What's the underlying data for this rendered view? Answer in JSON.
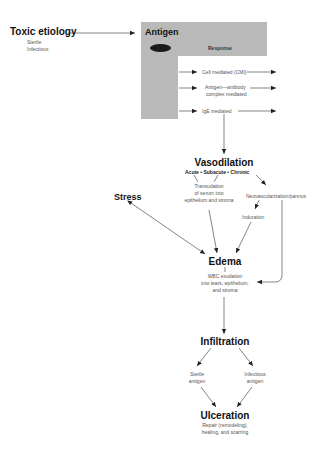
{
  "diagram": {
    "toxic_etiology": {
      "title": "Toxic etiology",
      "items": [
        "Sterile",
        "Infectious"
      ]
    },
    "antigen_box": {
      "title": "Antigen",
      "response_label": "Response",
      "responses": [
        {
          "line1": "Cell mediated (CMI)",
          "line2": ""
        },
        {
          "line1": "Antigen—antibody",
          "line2": "complex mediated"
        },
        {
          "line1": "IgE mediated",
          "line2": ""
        }
      ],
      "fill_color": "#b9b9b9"
    },
    "vasodilation": {
      "title": "Vasodilation",
      "phases": [
        "Acute",
        "Subacute",
        "Chronic"
      ],
      "separator": "•",
      "transudation": [
        "Transudation",
        "of serum into",
        "epithelium and stroma"
      ],
      "neovascularization": "Neovascularization/pannus",
      "induration": "Induration"
    },
    "stress": {
      "title": "Stress"
    },
    "edema": {
      "title": "Edema",
      "detail": [
        "WBC exudation",
        "into tears, epithelium,",
        "and stroma"
      ]
    },
    "infiltration": {
      "title": "Infiltration",
      "sterile": [
        "Sterile",
        "antigen"
      ],
      "infectious": [
        "Infectious",
        "antigen"
      ]
    },
    "ulceration": {
      "title": "Ulceration",
      "detail": [
        "Repair (remodeling),",
        "healing, and scarring"
      ]
    }
  }
}
